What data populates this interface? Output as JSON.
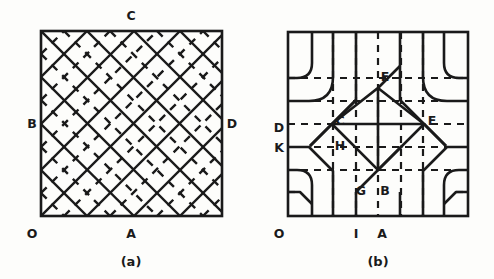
{
  "figure": {
    "kind": "line-diagram",
    "background_color": "#fdfdfb",
    "ink_color": "#1a1a1a",
    "panels": [
      {
        "id": "a",
        "caption": "(a)",
        "frame": {
          "x": 41,
          "y": 31,
          "width": 181,
          "height": 185
        },
        "description": "square domain filled with a 45-degree diagonal lattice; solid diagonals in one family and alternating dashed diagonals",
        "labels": [
          {
            "text": "C",
            "x": 131,
            "y": 20,
            "anchor": "middle"
          },
          {
            "text": "B",
            "x": 32,
            "y": 128,
            "anchor": "middle"
          },
          {
            "text": "D",
            "x": 232,
            "y": 128,
            "anchor": "middle"
          },
          {
            "text": "O",
            "x": 32,
            "y": 238,
            "anchor": "middle"
          },
          {
            "text": "A",
            "x": 131,
            "y": 238,
            "anchor": "middle"
          }
        ],
        "caption_pos": {
          "x": 131,
          "y": 266
        }
      },
      {
        "id": "b",
        "caption": "(b)",
        "frame": {
          "x": 288,
          "y": 32,
          "width": 180,
          "height": 184
        },
        "description": "square domain with central solid diamond subdivided into four cells, surrounded by rounded contour bands and dashed grid lines",
        "labels": [
          {
            "text": "E",
            "x": 385,
            "y": 81,
            "anchor": "middle"
          },
          {
            "text": "C",
            "x": 340,
            "y": 125,
            "anchor": "middle"
          },
          {
            "text": "F",
            "x": 432,
            "y": 125,
            "anchor": "middle"
          },
          {
            "text": "D",
            "x": 279,
            "y": 132,
            "anchor": "middle"
          },
          {
            "text": "K",
            "x": 279,
            "y": 152,
            "anchor": "middle"
          },
          {
            "text": "H",
            "x": 340,
            "y": 150,
            "anchor": "middle"
          },
          {
            "text": "G",
            "x": 361,
            "y": 195,
            "anchor": "middle"
          },
          {
            "text": "B",
            "x": 385,
            "y": 195,
            "anchor": "middle"
          },
          {
            "text": "O",
            "x": 279,
            "y": 238,
            "anchor": "middle"
          },
          {
            "text": "I",
            "x": 356,
            "y": 238,
            "anchor": "middle"
          },
          {
            "text": "A",
            "x": 382,
            "y": 238,
            "anchor": "middle"
          }
        ],
        "caption_pos": {
          "x": 378,
          "y": 266
        }
      }
    ]
  }
}
